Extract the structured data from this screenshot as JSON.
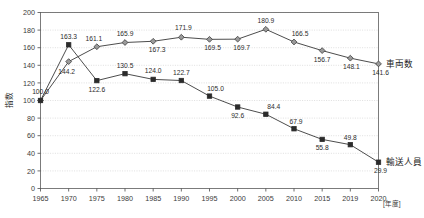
{
  "chart_data": {
    "type": "line",
    "title": "",
    "xlabel": "",
    "ylabel": "指数",
    "x_unit": "[年度]",
    "categories": [
      "1965",
      "1970",
      "1975",
      "1980",
      "1985",
      "1990",
      "1995",
      "2000",
      "2005",
      "2010",
      "2015",
      "2019",
      "2020"
    ],
    "ylim": [
      0,
      200
    ],
    "ytick_step": 20,
    "yticks": [
      "200",
      "180",
      "160",
      "140",
      "120",
      "100",
      "80",
      "60",
      "40",
      "20",
      "0"
    ],
    "grid": true,
    "legend_position": "right",
    "series": [
      {
        "name": "車両数",
        "marker": "diamond",
        "color": "#9a9a9a",
        "values": [
          100.0,
          144.2,
          161.1,
          165.9,
          167.3,
          171.9,
          169.5,
          169.7,
          180.9,
          166.5,
          156.7,
          148.1,
          141.6
        ],
        "labels": [
          "100.0",
          "144.2",
          "161.1",
          "165.9",
          "167.3",
          "171.9",
          "169.5",
          "169.7",
          "180.9",
          "166.5",
          "156.7",
          "148.1",
          "141.6"
        ]
      },
      {
        "name": "輸送人員",
        "marker": "square",
        "color": "#2b2b2b",
        "values": [
          100.0,
          163.3,
          122.6,
          130.5,
          124.0,
          122.7,
          105.0,
          92.6,
          84.4,
          67.9,
          55.8,
          49.8,
          29.9
        ],
        "labels": [
          "100.0",
          "163.3",
          "122.6",
          "130.5",
          "124.0",
          "122.7",
          "105.0",
          "92.6",
          "84.4",
          "67.9",
          "55.8",
          "49.8",
          "29.9"
        ]
      }
    ]
  },
  "legend": {
    "items": [
      {
        "label": "車両数"
      },
      {
        "label": "輸送人員"
      }
    ]
  }
}
